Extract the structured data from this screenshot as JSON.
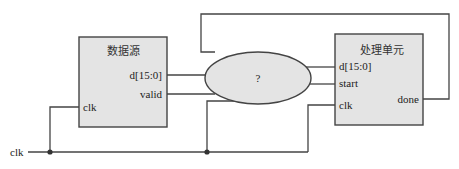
{
  "diagram": {
    "colors": {
      "block_fill": "#e4e4e4",
      "stroke": "#444444",
      "background": "#ffffff"
    },
    "input_signal": "clk",
    "source_block": {
      "title": "数据源",
      "ports": {
        "data": "d[15:0]",
        "valid": "valid",
        "clk": "clk"
      }
    },
    "unknown_block": {
      "label": "?"
    },
    "processing_block": {
      "title": "处理单元",
      "ports": {
        "data": "d[15:0]",
        "start": "start",
        "clk": "clk",
        "done": "done"
      }
    }
  }
}
